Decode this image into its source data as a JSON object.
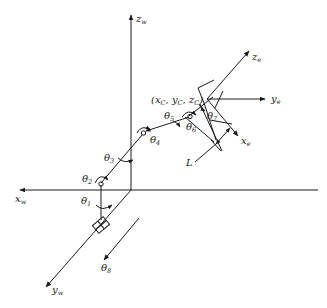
{
  "diagram": {
    "type": "robot-arm-kinematics",
    "world_axes": {
      "z": {
        "main": "z",
        "sub": "w"
      },
      "x": {
        "main": "x",
        "sub": "w"
      },
      "y": {
        "main": "y",
        "sub": "w"
      }
    },
    "end_effector_axes": {
      "z": {
        "main": "z",
        "sub": "e"
      },
      "y": {
        "main": "y",
        "sub": "e"
      },
      "x": {
        "main": "x",
        "sub": "e"
      }
    },
    "joints": [
      {
        "main": "θ",
        "sub": "1"
      },
      {
        "main": "θ",
        "sub": "2"
      },
      {
        "main": "θ",
        "sub": "3"
      },
      {
        "main": "θ",
        "sub": "4"
      },
      {
        "main": "θ",
        "sub": "5"
      },
      {
        "main": "θ",
        "sub": "6"
      },
      {
        "main": "θ",
        "sub": "7"
      },
      {
        "main": "θ",
        "sub": "8"
      }
    ],
    "end_point_label": "(x",
    "end_point_parts": [
      "(x",
      "C",
      ", y",
      "C",
      ", z",
      "C",
      ")"
    ],
    "length_label": "L"
  }
}
